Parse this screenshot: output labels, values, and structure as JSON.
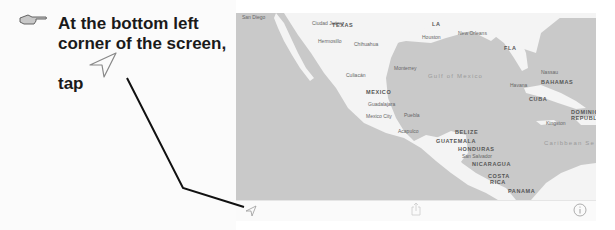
{
  "instruction": {
    "icon": "pointing-hand-icon",
    "line1": "At the bottom left",
    "line2": "corner of the screen,",
    "tap_label": "tap",
    "tap_icon": "location-arrow-icon"
  },
  "map": {
    "colors": {
      "water": "#c9c9c9",
      "land": "#f4f4f4",
      "toolbar": "#fafafa",
      "pointer_line": "#111111"
    },
    "cities": [
      {
        "name": "San Diego"
      },
      {
        "name": "Ciudad Juárez"
      },
      {
        "name": "Hermosillo"
      },
      {
        "name": "Chihuahua"
      },
      {
        "name": "Monterrey"
      },
      {
        "name": "Culiacán"
      },
      {
        "name": "Guadalajara"
      },
      {
        "name": "Mexico City"
      },
      {
        "name": "Puebla"
      },
      {
        "name": "Acapulco"
      },
      {
        "name": "Houston"
      },
      {
        "name": "New Orleans"
      },
      {
        "name": "Havana"
      },
      {
        "name": "Nassau"
      },
      {
        "name": "Kingston"
      },
      {
        "name": "San Salvador"
      }
    ],
    "regions": [
      {
        "name": "TEXAS"
      },
      {
        "name": "LA"
      },
      {
        "name": "FLA"
      },
      {
        "name": "MEXICO"
      },
      {
        "name": "BAHAMAS"
      },
      {
        "name": "CUBA"
      },
      {
        "name": "DOMINICAN REPUBLIC"
      },
      {
        "name": "BELIZE"
      },
      {
        "name": "GUATEMALA"
      },
      {
        "name": "HONDURAS"
      },
      {
        "name": "NICARAGUA"
      },
      {
        "name": "COSTA RICA"
      },
      {
        "name": "PANAMA"
      }
    ],
    "water_bodies": [
      {
        "name": "Gulf of Mexico"
      },
      {
        "name": "Caribbean Se"
      }
    ]
  },
  "toolbar": {
    "left": "location-arrow-icon",
    "center": "share-icon",
    "right": "info-icon"
  }
}
